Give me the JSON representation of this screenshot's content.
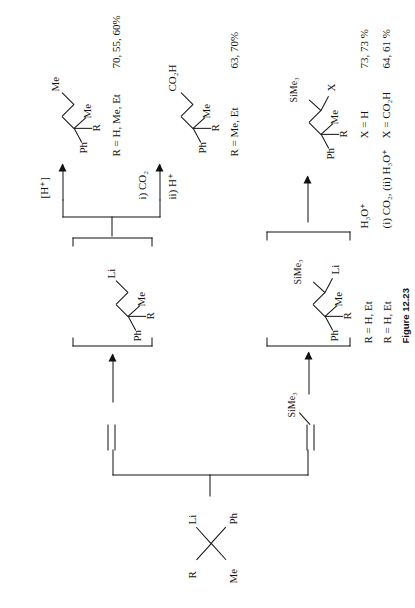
{
  "figure": {
    "caption": "Figure 12.23",
    "type": "chemical-reaction-scheme",
    "orientation": "rotated-90-ccw"
  },
  "starting_material": {
    "name": "benzylic-organolithium",
    "labels": {
      "li": "Li",
      "r": "R",
      "ph": "Ph",
      "me": "Me"
    }
  },
  "branches": {
    "top": {
      "reagent": {
        "name": "ethylene",
        "label": ""
      },
      "intermediate": {
        "labels": {
          "li": "Li",
          "r": "R",
          "ph": "Ph",
          "me": "Me"
        }
      },
      "products": [
        {
          "name": "protonated-product",
          "conditions": "[H⁺]",
          "labels": {
            "me_terminal": "Me",
            "r": "R",
            "ph": "Ph",
            "me": "Me"
          },
          "scope": "R = H, Me, Et",
          "yields": "70, 55, 60%"
        },
        {
          "name": "carboxylic-acid-product",
          "conditions_line1": "i) CO₂",
          "conditions_line2": "ii) H⁺",
          "labels": {
            "acid": "CO₂H",
            "r": "R",
            "ph": "Ph",
            "me": "Me"
          },
          "scope": "R = Me, Et",
          "yields": "63, 70%"
        }
      ]
    },
    "bottom": {
      "reagent": {
        "name": "vinyltrimethylsilane",
        "label": "SiMe₃"
      },
      "intermediate": {
        "labels": {
          "sime3": "SiMe₃",
          "li": "Li",
          "r": "R",
          "ph": "Ph",
          "me": "Me"
        },
        "scope": "R = H, Et"
      },
      "product": {
        "name": "silyl-product",
        "labels": {
          "sime3": "SiMe₃",
          "x": "X",
          "r": "R",
          "ph": "Ph",
          "me": "Me"
        },
        "scope": "R = H, Et"
      },
      "conditions_table": {
        "rows": [
          {
            "reagent": "H₃O⁺",
            "substituent": "X = H",
            "yields": "73, 73 %"
          },
          {
            "reagent": "(i) CO₂, (ii) H₃O⁺",
            "substituent": "X = CO₂H",
            "yields": "64, 61 %"
          }
        ]
      }
    }
  }
}
